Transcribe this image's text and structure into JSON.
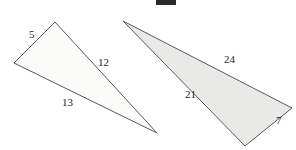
{
  "figure": {
    "background_color": "#ffffff",
    "top_marker": {
      "name": "top-black-bar",
      "color": "#2b2b2b",
      "x": 156,
      "y": 0,
      "width": 20,
      "height": 5
    },
    "triangles": [
      {
        "id": "left-triangle",
        "fill_color": "#fbfbfa",
        "stroke_color": "#595959",
        "stroke_width": 1,
        "points": "55,22 14,63 157,133",
        "vertices": [
          {
            "name": "top",
            "x": 55,
            "y": 22
          },
          {
            "name": "left",
            "x": 14,
            "y": 63
          },
          {
            "name": "bottom-right",
            "x": 157,
            "y": 133
          }
        ],
        "labels": [
          {
            "name": "side-label-5",
            "text": "5",
            "x": 29,
            "y": 38
          },
          {
            "name": "side-label-12",
            "text": "12",
            "x": 98,
            "y": 66
          },
          {
            "name": "side-label-13",
            "text": "13",
            "x": 62,
            "y": 106
          }
        ]
      },
      {
        "id": "right-triangle",
        "fill_color": "#e9e9e7",
        "stroke_color": "#595959",
        "stroke_width": 1,
        "points": "123,21 245,146 292,108",
        "vertices": [
          {
            "name": "left-apex",
            "x": 123,
            "y": 21
          },
          {
            "name": "bottom",
            "x": 245,
            "y": 146
          },
          {
            "name": "right",
            "x": 292,
            "y": 108
          }
        ],
        "labels": [
          {
            "name": "side-label-24",
            "text": "24",
            "x": 224,
            "y": 63
          },
          {
            "name": "side-label-21",
            "text": "21",
            "x": 185,
            "y": 98
          },
          {
            "name": "side-label-7",
            "text": "7",
            "x": 276,
            "y": 124
          }
        ]
      }
    ]
  }
}
